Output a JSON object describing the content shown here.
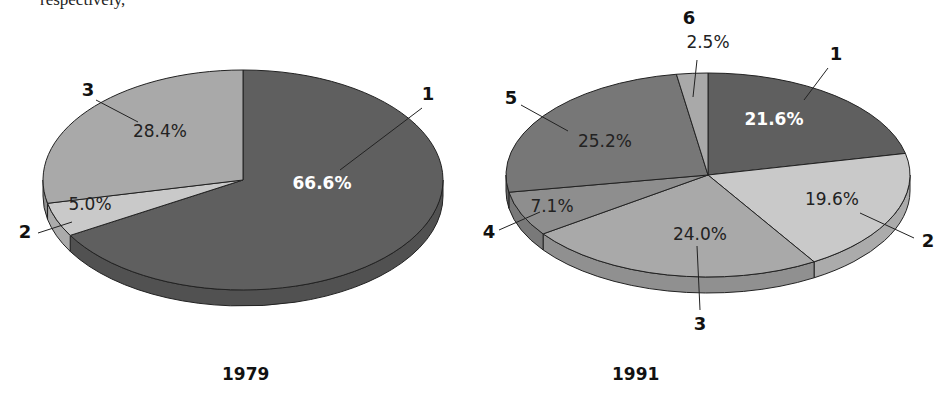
{
  "top_text": "respectively,",
  "chart_data": [
    {
      "type": "pie",
      "title": "1979",
      "style": "3d",
      "start_angle": "12 o'clock, clockwise",
      "slices": [
        {
          "label": "1",
          "value": 66.6,
          "display": "66.6%",
          "color": "#5f5f5f",
          "text_color": "#ffffff",
          "bold": true
        },
        {
          "label": "2",
          "value": 5.0,
          "display": "5.0%",
          "color": "#c9c9c9",
          "text_color": "#222222",
          "bold": false
        },
        {
          "label": "3",
          "value": 28.4,
          "display": "28.4%",
          "color": "#a9a9a9",
          "text_color": "#222222",
          "bold": false
        }
      ]
    },
    {
      "type": "pie",
      "title": "1991",
      "style": "3d",
      "start_angle": "12 o'clock, clockwise",
      "slices": [
        {
          "label": "1",
          "value": 21.6,
          "display": "21.6%",
          "color": "#5f5f5f",
          "text_color": "#ffffff",
          "bold": true
        },
        {
          "label": "2",
          "value": 19.6,
          "display": "19.6%",
          "color": "#c9c9c9",
          "text_color": "#222222",
          "bold": false
        },
        {
          "label": "3",
          "value": 24.0,
          "display": "24.0%",
          "color": "#a9a9a9",
          "text_color": "#222222",
          "bold": false
        },
        {
          "label": "4",
          "value": 7.1,
          "display": "7.1%",
          "color": "#8e8e8e",
          "text_color": "#222222",
          "bold": false
        },
        {
          "label": "5",
          "value": 25.2,
          "display": "25.2%",
          "color": "#777777",
          "text_color": "#222222",
          "bold": false
        },
        {
          "label": "6",
          "value": 2.5,
          "display": "2.5%",
          "color": "#a9a9a9",
          "text_color": "#222222",
          "bold": false
        }
      ]
    }
  ],
  "layout": {
    "pies": [
      {
        "cx": 243,
        "cy": 180,
        "rx": 200,
        "ry": 110,
        "depth": 16,
        "pct_pos": [
          [
            322,
            189
          ],
          [
            90,
            210
          ],
          [
            160,
            137
          ]
        ],
        "callouts": [
          {
            "num_pos": [
              428,
              100
            ],
            "line": [
              [
                422,
                108
              ],
              [
                340,
                170
              ]
            ]
          },
          {
            "num_pos": [
              25,
              238
            ],
            "line": [
              [
                38,
                233
              ],
              [
                72,
                222
              ]
            ]
          },
          {
            "num_pos": [
              88,
              96
            ],
            "line": [
              [
                96,
                100
              ],
              [
                138,
                122
              ]
            ]
          }
        ]
      },
      {
        "cx": 708,
        "cy": 175,
        "rx": 202,
        "ry": 102,
        "depth": 16,
        "pct_pos": [
          [
            774,
            125
          ],
          [
            832,
            205
          ],
          [
            700,
            240
          ],
          [
            552,
            212
          ],
          [
            605,
            147
          ],
          [
            708,
            48
          ]
        ],
        "callouts": [
          {
            "num_pos": [
              836,
              60
            ],
            "line": [
              [
                828,
                68
              ],
              [
                804,
                100
              ]
            ]
          },
          {
            "num_pos": [
              928,
              247
            ],
            "line": [
              [
                914,
                238
              ],
              [
                860,
                213
              ]
            ]
          },
          {
            "num_pos": [
              700,
              330
            ],
            "line": [
              [
                700,
                310
              ],
              [
                697,
                246
              ]
            ]
          },
          {
            "num_pos": [
              489,
              238
            ],
            "line": [
              [
                499,
                230
              ],
              [
                540,
                212
              ]
            ]
          },
          {
            "num_pos": [
              511,
              104
            ],
            "line": [
              [
                521,
                105
              ],
              [
                568,
                131
              ]
            ]
          },
          {
            "num_pos": [
              689,
              24
            ],
            "line": [
              [
                697,
                60
              ],
              [
                693,
                97
              ]
            ]
          }
        ]
      }
    ],
    "years": [
      {
        "x": 222,
        "y": 382
      },
      {
        "x": 612,
        "y": 382
      }
    ]
  }
}
